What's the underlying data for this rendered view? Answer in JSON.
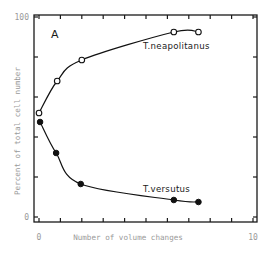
{
  "chart_data": {
    "type": "line",
    "title": "",
    "panel_label": "A",
    "xlabel": "Number of volume changes",
    "ylabel": "Percent of total cell number",
    "xlim": [
      0,
      10
    ],
    "ylim": [
      0,
      100
    ],
    "x_tick_labels": [
      {
        "value": 0,
        "label": "0"
      },
      {
        "value": 10,
        "label": "10"
      }
    ],
    "y_tick_labels": [
      {
        "value": 0,
        "label": "0"
      },
      {
        "value": 100,
        "label": "100"
      }
    ],
    "x_ticks": [
      0,
      1,
      2,
      3,
      4,
      5,
      6,
      7,
      8,
      9,
      10
    ],
    "y_ticks": [
      0,
      20,
      40,
      60,
      80,
      100
    ],
    "grid": false,
    "legend": "inline labels",
    "series": [
      {
        "name": "T.neapolitanus",
        "marker": "open-circle",
        "x": [
          0.0,
          0.85,
          2.0,
          6.3,
          7.45
        ],
        "values": [
          52,
          68,
          78.5,
          92.5,
          92.5
        ],
        "label_position": {
          "x": 143,
          "y": 49
        }
      },
      {
        "name": "T.versutus",
        "marker": "filled-circle",
        "x": [
          0.05,
          0.8,
          1.95,
          6.3,
          7.45
        ],
        "values": [
          47.5,
          32,
          16.5,
          8.5,
          7.5
        ],
        "label_position": {
          "x": 143,
          "y": 192
        }
      }
    ]
  },
  "colors": {
    "ink": "#111111",
    "tick_text": "#9a9a9a",
    "background": "#ffffff"
  }
}
